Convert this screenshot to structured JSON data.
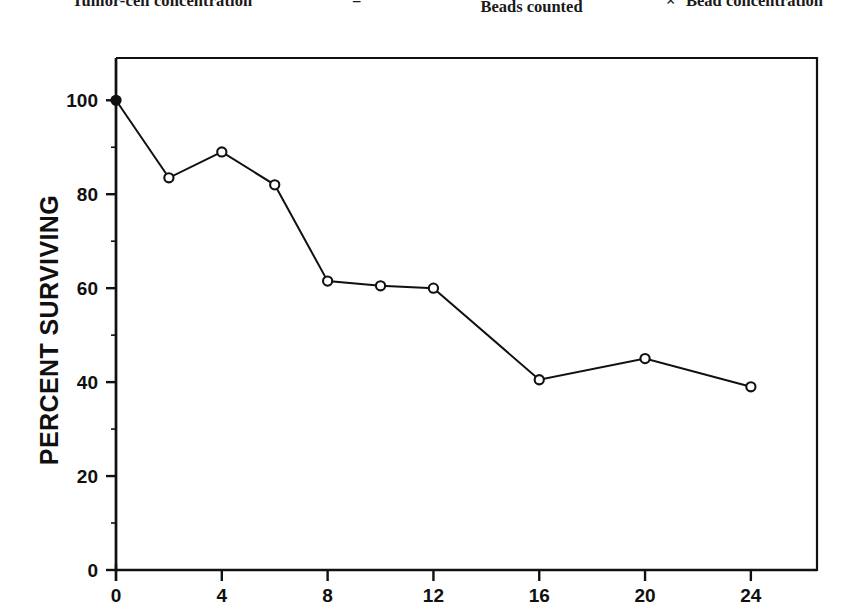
{
  "formula": {
    "lhs": "Tumor-cell concentration",
    "equals": "=",
    "numerator": "Tumor cells counted",
    "denominator": "Beads counted",
    "times": "×",
    "rhs": "Bead concentration"
  },
  "chart_data": {
    "type": "line",
    "title": "",
    "xlabel": "",
    "ylabel": "PERCENT SURVIVING",
    "xlim": [
      0,
      26.5
    ],
    "ylim": [
      0,
      109
    ],
    "xticks": [
      0,
      4,
      8,
      12,
      16,
      20,
      24
    ],
    "xtick_labels": [
      "0",
      "4",
      "8",
      "12",
      "16",
      "20",
      "24"
    ],
    "yticks": [
      0,
      20,
      40,
      60,
      80,
      100
    ],
    "ytick_labels": [
      "0",
      "20",
      "40",
      "60",
      "80",
      "100"
    ],
    "grid": false,
    "legend": null,
    "marker": "open-circle",
    "line_color": "#111111",
    "marker_face_color": "#ffffff",
    "marker_edge_color": "#111111",
    "x": [
      0,
      2,
      4,
      6,
      8,
      10,
      12,
      16,
      20,
      24
    ],
    "values": [
      100,
      83.5,
      89,
      82,
      61.5,
      60.5,
      60,
      40.5,
      45,
      39
    ],
    "series": [
      {
        "name": "Percent surviving",
        "x": [
          0,
          2,
          4,
          6,
          8,
          10,
          12,
          16,
          20,
          24
        ],
        "values": [
          100,
          83.5,
          89,
          82,
          61.5,
          60.5,
          60,
          40.5,
          45,
          39
        ]
      }
    ]
  }
}
